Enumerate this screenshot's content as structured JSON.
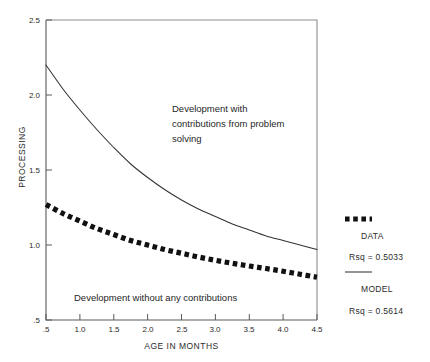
{
  "chart_data": {
    "type": "line",
    "title": "",
    "xlabel": "AGE IN MONTHS",
    "ylabel": "PROCESSING",
    "xlim": [
      0.5,
      4.5
    ],
    "ylim": [
      0.5,
      2.5
    ],
    "xticks": [
      ".5",
      "1.0",
      "1.5",
      "2.0",
      "2.5",
      "3.0",
      "3.5",
      "4.0",
      "4.5"
    ],
    "xtick_values": [
      0.5,
      1.0,
      1.5,
      2.0,
      2.5,
      3.0,
      3.5,
      4.0,
      4.5
    ],
    "yticks": [
      ".5",
      "1.0",
      "1.5",
      "2.0",
      "2.5"
    ],
    "ytick_values": [
      0.5,
      1.0,
      1.5,
      2.0,
      2.5
    ],
    "grid": false,
    "legend_position": "right-outside",
    "x": [
      0.5,
      0.75,
      1.0,
      1.25,
      1.5,
      1.75,
      2.0,
      2.25,
      2.5,
      2.75,
      3.0,
      3.25,
      3.5,
      3.75,
      4.0,
      4.25,
      4.5
    ],
    "series": [
      {
        "name": "MODEL",
        "style": "solid",
        "rsq_label": "Rsq = 0.5614",
        "rsq": 0.5614,
        "values": [
          2.2,
          2.04,
          1.9,
          1.77,
          1.65,
          1.54,
          1.45,
          1.37,
          1.3,
          1.24,
          1.19,
          1.14,
          1.1,
          1.06,
          1.03,
          1.0,
          0.97
        ]
      },
      {
        "name": "DATA",
        "style": "dotted",
        "rsq_label": "Rsq = 0.5033",
        "rsq": 0.5033,
        "values": [
          1.27,
          1.21,
          1.16,
          1.11,
          1.07,
          1.03,
          1.0,
          0.97,
          0.945,
          0.92,
          0.898,
          0.878,
          0.86,
          0.843,
          0.825,
          0.805,
          0.785
        ]
      }
    ],
    "annotations": [
      {
        "name": "with-contributions",
        "lines": [
          "Development with",
          "contributions from problem",
          "solving"
        ]
      },
      {
        "name": "without-contributions",
        "lines": [
          "Development without any contributions"
        ]
      }
    ],
    "colors": {
      "axis": "#5a5a5a",
      "model_line": "#333333",
      "data_line": "#111111",
      "text": "#2b2b2b",
      "background": "#ffffff"
    }
  }
}
